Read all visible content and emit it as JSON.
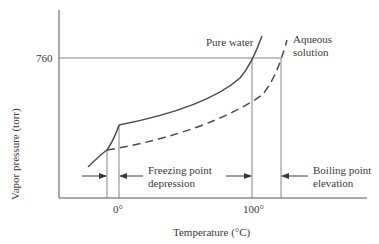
{
  "diagram": {
    "title": "",
    "y_axis": {
      "label": "Vapor pressure (torr)",
      "tick": "760"
    },
    "x_axis": {
      "label": "Temperature (°C)",
      "ticks": [
        "0°",
        "100°"
      ]
    },
    "curves": [
      {
        "name": "Pure water",
        "style": "solid"
      },
      {
        "name": "Aqueous solution",
        "style": "dashed",
        "label_line1": "Aqueous",
        "label_line2": "solution"
      }
    ],
    "annotations": {
      "freezing": {
        "line1": "Freezing point",
        "line2": "depression"
      },
      "boiling": {
        "line1": "Boiling point",
        "line2": "elevation"
      }
    },
    "colors": {
      "line": "#4a4a4a",
      "text": "#3a3a3a",
      "background": "#ffffff"
    }
  }
}
